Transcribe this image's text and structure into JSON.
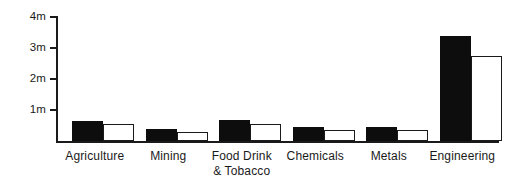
{
  "chart_data": {
    "type": "bar",
    "title": "",
    "subtitle": "",
    "xlabel": "",
    "ylabel": "",
    "ylim": [
      0,
      4000000
    ],
    "grid": false,
    "legend_position": "none",
    "y_tick_labels": [
      "4m",
      "3m",
      "2m",
      "1m"
    ],
    "y_tick_values": [
      4000000,
      3000000,
      2000000,
      1000000
    ],
    "categories": [
      "Agriculture",
      "Mining",
      "Food Drink\n& Tobacco",
      "Chemicals",
      "Metals",
      "Engineering"
    ],
    "series": [
      {
        "name": "series-solid",
        "style": "filled-black",
        "color": "#0d0d0d",
        "values": [
          650000,
          400000,
          680000,
          450000,
          450000,
          3400000
        ]
      },
      {
        "name": "series-hollow",
        "style": "outlined-white",
        "color": "#ffffff",
        "values": [
          550000,
          300000,
          560000,
          350000,
          360000,
          2750000
        ]
      }
    ]
  },
  "axis": {
    "y_labels": [
      {
        "text": "4m",
        "value": 4000000
      },
      {
        "text": "3m",
        "value": 3000000
      },
      {
        "text": "2m",
        "value": 2000000
      },
      {
        "text": "1m",
        "value": 1000000
      }
    ]
  },
  "colors": {
    "ink": "#1a1a1a",
    "solid_bar": "#0d0d0d",
    "hollow_bar": "#ffffff",
    "background": "#ffffff"
  }
}
